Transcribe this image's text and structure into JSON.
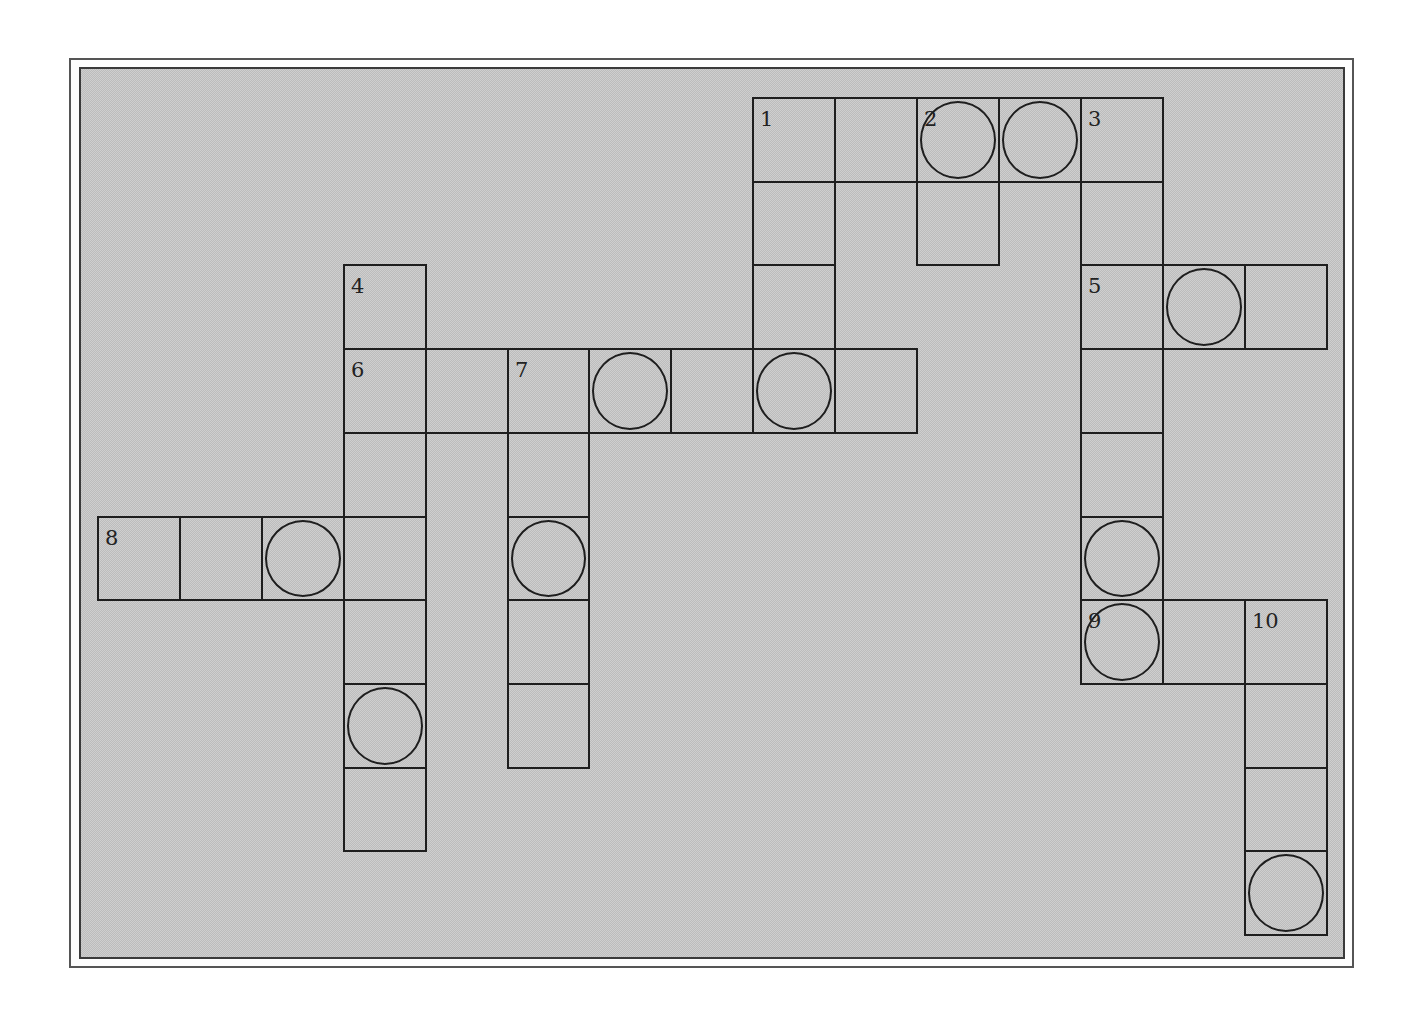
{
  "puzzle": {
    "type": "crossword",
    "cells": [
      {
        "col": 8,
        "row": 0,
        "number": "1",
        "circled": false
      },
      {
        "col": 9,
        "row": 0,
        "number": "",
        "circled": false
      },
      {
        "col": 10,
        "row": 0,
        "number": "2",
        "circled": true
      },
      {
        "col": 11,
        "row": 0,
        "number": "",
        "circled": true
      },
      {
        "col": 12,
        "row": 0,
        "number": "3",
        "circled": false
      },
      {
        "col": 8,
        "row": 1,
        "number": "",
        "circled": false
      },
      {
        "col": 10,
        "row": 1,
        "number": "",
        "circled": false
      },
      {
        "col": 12,
        "row": 1,
        "number": "",
        "circled": false
      },
      {
        "col": 3,
        "row": 2,
        "number": "4",
        "circled": false
      },
      {
        "col": 8,
        "row": 2,
        "number": "",
        "circled": false
      },
      {
        "col": 12,
        "row": 2,
        "number": "5",
        "circled": false
      },
      {
        "col": 13,
        "row": 2,
        "number": "",
        "circled": true
      },
      {
        "col": 14,
        "row": 2,
        "number": "",
        "circled": false
      },
      {
        "col": 3,
        "row": 3,
        "number": "6",
        "circled": false
      },
      {
        "col": 4,
        "row": 3,
        "number": "",
        "circled": false
      },
      {
        "col": 5,
        "row": 3,
        "number": "7",
        "circled": false
      },
      {
        "col": 6,
        "row": 3,
        "number": "",
        "circled": true
      },
      {
        "col": 7,
        "row": 3,
        "number": "",
        "circled": false
      },
      {
        "col": 8,
        "row": 3,
        "number": "",
        "circled": true
      },
      {
        "col": 9,
        "row": 3,
        "number": "",
        "circled": false
      },
      {
        "col": 12,
        "row": 3,
        "number": "",
        "circled": false
      },
      {
        "col": 3,
        "row": 4,
        "number": "",
        "circled": false
      },
      {
        "col": 5,
        "row": 4,
        "number": "",
        "circled": false
      },
      {
        "col": 12,
        "row": 4,
        "number": "",
        "circled": false
      },
      {
        "col": 0,
        "row": 5,
        "number": "8",
        "circled": false
      },
      {
        "col": 1,
        "row": 5,
        "number": "",
        "circled": false
      },
      {
        "col": 2,
        "row": 5,
        "number": "",
        "circled": true
      },
      {
        "col": 3,
        "row": 5,
        "number": "",
        "circled": false
      },
      {
        "col": 5,
        "row": 5,
        "number": "",
        "circled": true
      },
      {
        "col": 12,
        "row": 5,
        "number": "",
        "circled": true
      },
      {
        "col": 3,
        "row": 6,
        "number": "",
        "circled": false
      },
      {
        "col": 5,
        "row": 6,
        "number": "",
        "circled": false
      },
      {
        "col": 12,
        "row": 6,
        "number": "9",
        "circled": true
      },
      {
        "col": 13,
        "row": 6,
        "number": "",
        "circled": false
      },
      {
        "col": 14,
        "row": 6,
        "number": "10",
        "circled": false
      },
      {
        "col": 3,
        "row": 7,
        "number": "",
        "circled": true
      },
      {
        "col": 5,
        "row": 7,
        "number": "",
        "circled": false
      },
      {
        "col": 14,
        "row": 7,
        "number": "",
        "circled": false
      },
      {
        "col": 3,
        "row": 8,
        "number": "",
        "circled": false
      },
      {
        "col": 14,
        "row": 8,
        "number": "",
        "circled": false
      },
      {
        "col": 14,
        "row": 9,
        "number": "",
        "circled": true
      }
    ]
  }
}
